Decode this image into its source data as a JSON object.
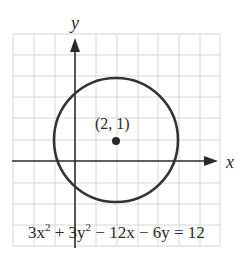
{
  "figure": {
    "axis_labels": {
      "x": "x",
      "y": "y"
    },
    "center_label": "(2, 1)",
    "equation": {
      "parts": [
        "3x",
        "2",
        " + 3y",
        "2",
        " − 12x − 6y = 12"
      ],
      "full": "3x^2 + 3y^2 − 12x − 6y = 12"
    },
    "circle": {
      "center": [
        2,
        1
      ],
      "radius": 3
    },
    "grid": {
      "x_min": -3,
      "x_max": 7,
      "y_min": -4,
      "y_max": 6,
      "step": 1
    },
    "colors": {
      "grid": "#d6d6d6",
      "axis": "#2a2a2a",
      "circle": "#333333",
      "background": "#ffffff"
    }
  }
}
